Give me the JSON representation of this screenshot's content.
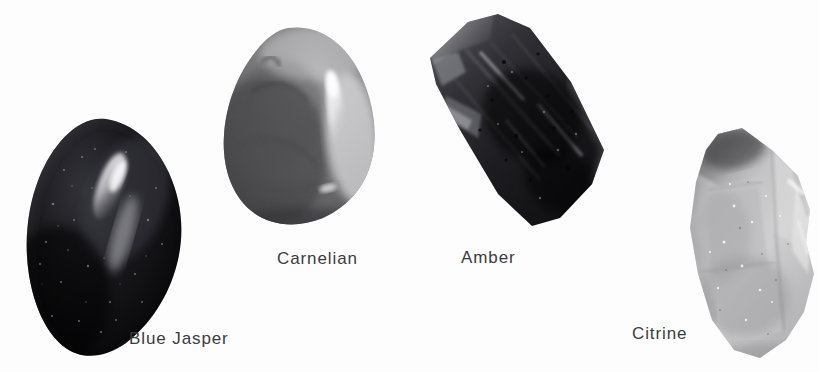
{
  "plate": {
    "background_color": "#fdfdfd",
    "caption_color": "#3b3b3d",
    "width": 819,
    "height": 372,
    "medium": "grayscale photograph"
  },
  "specimens": [
    {
      "id": "blue-jasper",
      "label": "Blue Jasper",
      "form": "tumbled polished pebble",
      "outline": "rounded ovoid, tilted, wider at the lower left",
      "tone": "very dark / near black",
      "colors": {
        "body": "#121214",
        "shadow": "#050506",
        "midtone": "#2a2a2e",
        "highlight": "#e6e6e8",
        "rim": "#4a4a50"
      },
      "highlight": "long bright elongated specular streak running down the upper right face",
      "speckles": true
    },
    {
      "id": "carnelian",
      "label": "Carnelian",
      "form": "tumbled polished pebble",
      "outline": "broad rounded teardrop, narrow at the top, wide rounded base",
      "tone": "medium gray",
      "colors": {
        "body": "#7e7e80",
        "shadow": "#3c3c3e",
        "midtone": "#636366",
        "highlight": "#f1f1f2",
        "rim": "#9a9a9c"
      },
      "highlight": "bright vertical specular band along the right flank",
      "speckles": false
    },
    {
      "id": "amber",
      "label": "Amber",
      "form": "rough elongated block",
      "outline": "tilted rectangular prism with blunt chipped corners",
      "tone": "dark gray with rough texture",
      "colors": {
        "body": "#2b2b2d",
        "shadow": "#131314",
        "midtone": "#48484b",
        "highlight": "#d8d8da",
        "rim": "#6a6a6e"
      },
      "highlight": "pale chipped facet along the upper left edge",
      "speckles": true
    },
    {
      "id": "citrine",
      "label": "Citrine",
      "form": "rough crystal chunk",
      "outline": "angular faceted wedge, pointed upper left, blunt base",
      "tone": "light gray, translucent",
      "colors": {
        "body": "#c2c2c3",
        "shadow": "#4e4e50",
        "midtone": "#a2a2a4",
        "highlight": "#f3f3f3",
        "rim": "#d6d6d7"
      },
      "highlight": "pale translucent faces with a dark shoulder at the top left",
      "speckles": true
    }
  ]
}
